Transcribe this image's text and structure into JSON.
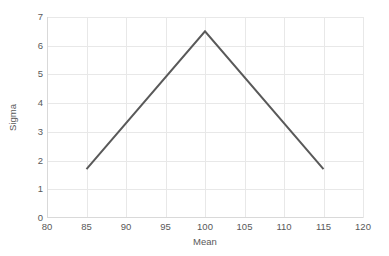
{
  "chart_data": {
    "type": "line",
    "title": "",
    "xlabel": "Mean",
    "ylabel": "Sigma",
    "x": [
      85,
      100,
      115
    ],
    "values": [
      1.7,
      6.5,
      1.7
    ],
    "series": [
      {
        "name": "Sigma vs Mean",
        "x": [
          85,
          100,
          115
        ],
        "values": [
          1.7,
          6.5,
          1.7
        ]
      }
    ],
    "xlim": [
      80,
      120
    ],
    "ylim": [
      0,
      7
    ],
    "xticks": [
      80,
      85,
      90,
      95,
      100,
      105,
      110,
      115,
      120
    ],
    "yticks": [
      0,
      1,
      2,
      3,
      4,
      5,
      6,
      7
    ],
    "xtick_labels": [
      "80",
      "85",
      "90",
      "95",
      "100",
      "105",
      "110",
      "115",
      "120"
    ],
    "ytick_labels": [
      "0",
      "1",
      "2",
      "3",
      "4",
      "5",
      "6",
      "7"
    ],
    "grid": true,
    "grid_axes": "both",
    "legend": false,
    "legend_position": "none",
    "markers": false,
    "colors": {
      "line": "#595959",
      "grid": "#e8e8e8",
      "axis": "#d9d9d9",
      "text": "#595959",
      "background": "#ffffff"
    },
    "line_width": 2
  }
}
